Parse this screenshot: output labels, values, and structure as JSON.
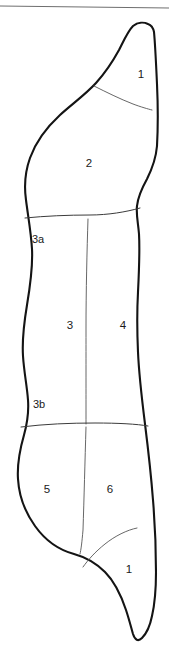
{
  "figure": {
    "colors": {
      "outline": "#141414",
      "divider": "#3b3b3b",
      "rule": "#6e6e6e",
      "background": "#ffffff"
    },
    "top_rule": {
      "name": "horizontal-rule",
      "y_left": 6,
      "y_right": 8
    },
    "regions": [
      {
        "id": "r1-top",
        "label": "1",
        "x": 141,
        "y": 75
      },
      {
        "id": "r2",
        "label": "2",
        "x": 89,
        "y": 164
      },
      {
        "id": "r3a",
        "label": "3a",
        "x": 38,
        "y": 240
      },
      {
        "id": "r3",
        "label": "3",
        "x": 70,
        "y": 326
      },
      {
        "id": "r4",
        "label": "4",
        "x": 123,
        "y": 326
      },
      {
        "id": "r3b",
        "label": "3b",
        "x": 39,
        "y": 405
      },
      {
        "id": "r5",
        "label": "5",
        "x": 47,
        "y": 490
      },
      {
        "id": "r6",
        "label": "6",
        "x": 110,
        "y": 490
      },
      {
        "id": "r1-bottom",
        "label": "1",
        "x": 129,
        "y": 570
      }
    ],
    "dividers": [
      {
        "id": "upper-oblique",
        "name": "divider-region1-region2"
      },
      {
        "id": "waist-horizontal",
        "name": "divider-region2-region3a"
      },
      {
        "id": "mid-vertical",
        "name": "divider-region3-region4"
      },
      {
        "id": "hip-horizontal",
        "name": "divider-region3b-region5"
      },
      {
        "id": "lower-vertical",
        "name": "divider-region5-region6"
      },
      {
        "id": "lower-oblique",
        "name": "divider-region6-region1"
      }
    ]
  }
}
